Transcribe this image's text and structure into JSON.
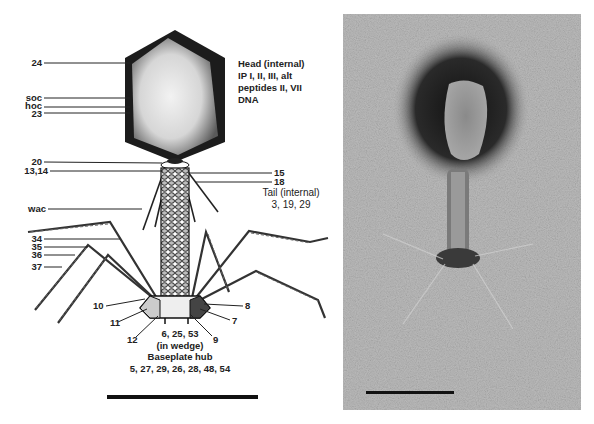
{
  "figure": {
    "left_panel": {
      "title": "Bacteriophage T4 structure diagram",
      "head_label": {
        "lines": [
          "Head (internal)",
          "IP I, II, III, alt",
          "peptides II, VII",
          "DNA"
        ]
      },
      "tail_label": {
        "lines": [
          "Tail (internal)",
          "3, 19, 29"
        ]
      },
      "labels_left": [
        {
          "text": "24",
          "y": 63
        },
        {
          "text": "soc",
          "y": 98
        },
        {
          "text": "hoc",
          "y": 107
        },
        {
          "text": "23",
          "y": 113
        },
        {
          "text": "20",
          "y": 162
        },
        {
          "text": "13,14",
          "y": 171
        },
        {
          "text": "wac",
          "y": 209
        },
        {
          "text": "34",
          "y": 239
        },
        {
          "text": "35",
          "y": 247
        },
        {
          "text": "36",
          "y": 255
        },
        {
          "text": "37",
          "y": 267
        }
      ],
      "labels_right": [
        {
          "text": "15",
          "y": 173
        },
        {
          "text": "18",
          "y": 182
        }
      ],
      "labels_baseplate": [
        {
          "text": "10",
          "x": 93,
          "y": 306
        },
        {
          "text": "11",
          "x": 110,
          "y": 323
        },
        {
          "text": "12",
          "x": 127,
          "y": 340
        },
        {
          "text": "8",
          "x": 245,
          "y": 306
        },
        {
          "text": "7",
          "x": 232,
          "y": 321
        },
        {
          "text": "9",
          "x": 213,
          "y": 340
        }
      ],
      "wedge_label": {
        "lines": [
          "6, 25, 53",
          "(in wedge)"
        ]
      },
      "hub_label": {
        "lines": [
          "Baseplate hub",
          "5, 27, 29, 26, 28, 48, 54"
        ]
      },
      "scale_bar": {
        "x": 107,
        "y": 396,
        "width": 151
      }
    },
    "right_panel": {
      "title": "Electron micrograph of bacteriophage",
      "scale_bar": {
        "x": 23,
        "y": 377,
        "width": 88
      }
    },
    "colors": {
      "ink": "#222222",
      "background": "#ffffff",
      "micrograph_bg": "#b8b8b8",
      "stain_dark": "#1a1a1a"
    }
  }
}
